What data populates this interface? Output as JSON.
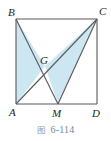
{
  "figure": {
    "caption_label": "图",
    "caption_number": "6-114",
    "caption_color": "#6f86a8",
    "outline_color": "#58595b",
    "fill_color": "#cce7f2",
    "label_color": "#231f20",
    "background": "#ffffff",
    "vertices": [
      {
        "name": "B",
        "label": "B",
        "x": 16,
        "y": 19,
        "label_x": 8,
        "label_y": 16
      },
      {
        "name": "C",
        "label": "C",
        "x": 97,
        "y": 19,
        "label_x": 99,
        "label_y": 15
      },
      {
        "name": "A",
        "label": "A",
        "x": 16,
        "y": 104,
        "label_x": 9,
        "label_y": 115
      },
      {
        "name": "D",
        "label": "D",
        "x": 97,
        "y": 104,
        "label_x": 93,
        "label_y": 116
      },
      {
        "name": "M",
        "label": "M",
        "x": 58,
        "y": 104,
        "label_x": 53,
        "label_y": 116
      },
      {
        "name": "G",
        "label": "G",
        "x": 45,
        "y": 66,
        "label_x": 41,
        "label_y": 64
      }
    ],
    "segments": [
      {
        "name": "side-AB",
        "from": "A",
        "to": "B"
      },
      {
        "name": "side-BC",
        "from": "B",
        "to": "C"
      },
      {
        "name": "side-CD",
        "from": "C",
        "to": "D"
      },
      {
        "name": "side-AD",
        "from": "A",
        "to": "D"
      },
      {
        "name": "cevian-BM",
        "from": "B",
        "to": "M"
      },
      {
        "name": "diagonal-AC",
        "from": "A",
        "to": "C"
      },
      {
        "name": "cevian-MC",
        "from": "M",
        "to": "C"
      }
    ],
    "shaded_regions": [
      {
        "name": "triangle-ABG",
        "points": "16,19 45,66 16,104"
      },
      {
        "name": "triangle-GMC",
        "points": "45,66 58,104 97,19"
      }
    ]
  }
}
